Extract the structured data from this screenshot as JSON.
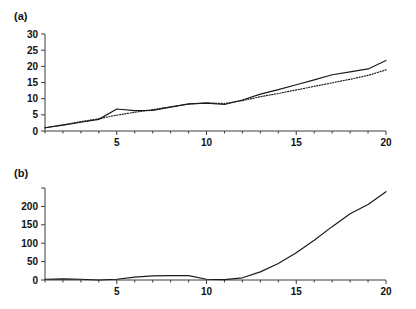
{
  "figure": {
    "background": "#ffffff",
    "ink": "#1a1a1a",
    "panels": [
      {
        "label": "(a)"
      },
      {
        "label": "(b)"
      }
    ]
  },
  "chart_data": [
    {
      "type": "line",
      "panel": "(a)",
      "title": "",
      "xlabel": "",
      "ylabel": "",
      "xlim": [
        1,
        20
      ],
      "ylim": [
        0,
        30
      ],
      "grid": false,
      "legend": "none",
      "xticks": [
        5,
        10,
        15,
        20
      ],
      "xtick_labels": [
        "5",
        "10",
        "15",
        "20"
      ],
      "xminor_ticks": [
        1,
        2,
        3,
        4,
        6,
        7,
        8,
        9,
        11,
        12,
        13,
        14,
        16,
        17,
        18,
        19
      ],
      "yticks": [
        0,
        5,
        10,
        15,
        20,
        25,
        30
      ],
      "ytick_labels": [
        "0",
        "5",
        "10",
        "15",
        "20",
        "25",
        "30"
      ],
      "x": [
        1,
        2,
        3,
        4,
        5,
        6,
        7,
        8,
        9,
        10,
        11,
        12,
        13,
        14,
        15,
        16,
        17,
        18,
        19,
        20
      ],
      "series": [
        {
          "name": "solid",
          "style": "solid",
          "color": "#1a1a1a",
          "values": [
            1.0,
            1.8,
            2.7,
            3.6,
            6.8,
            6.3,
            6.4,
            7.4,
            8.4,
            8.6,
            8.2,
            9.6,
            11.4,
            12.8,
            14.3,
            15.8,
            17.4,
            18.3,
            19.2,
            21.8
          ]
        },
        {
          "name": "dotted",
          "style": "dotted",
          "color": "#1a1a1a",
          "values": [
            1.0,
            1.9,
            2.9,
            3.8,
            4.9,
            5.8,
            6.6,
            7.5,
            8.3,
            8.7,
            8.5,
            9.4,
            10.6,
            11.6,
            12.7,
            13.8,
            14.9,
            16.0,
            17.2,
            18.9
          ]
        }
      ]
    },
    {
      "type": "line",
      "panel": "(b)",
      "title": "",
      "xlabel": "",
      "ylabel": "",
      "xlim": [
        1,
        20
      ],
      "ylim": [
        0,
        250
      ],
      "grid": false,
      "legend": "none",
      "xticks": [
        5,
        10,
        15,
        20
      ],
      "xtick_labels": [
        "5",
        "10",
        "15",
        "20"
      ],
      "xminor_ticks": [
        1,
        2,
        3,
        4,
        6,
        7,
        8,
        9,
        11,
        12,
        13,
        14,
        16,
        17,
        18,
        19
      ],
      "yticks": [
        0,
        50,
        100,
        150,
        200,
        250
      ],
      "ytick_labels": [
        "0",
        "50",
        "100",
        "150",
        "200",
        ""
      ],
      "x": [
        1,
        2,
        3,
        4,
        5,
        6,
        7,
        8,
        9,
        10,
        11,
        12,
        13,
        14,
        15,
        16,
        17,
        18,
        19,
        20
      ],
      "series": [
        {
          "name": "solid",
          "style": "solid",
          "color": "#1a1a1a",
          "values": [
            2,
            3,
            2,
            0,
            2,
            8,
            11,
            12,
            12,
            2,
            1,
            6,
            22,
            45,
            74,
            108,
            145,
            180,
            205,
            240
          ]
        }
      ]
    }
  ]
}
